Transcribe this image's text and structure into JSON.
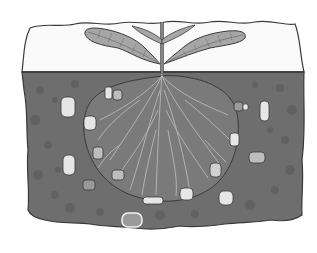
{
  "illustration": {
    "subject": "plant-rhizosphere",
    "description": "Grayscale cross-section of a seedling above ground with its root system in soil, surrounded by soil microbes",
    "colors": {
      "background": "#ffffff",
      "sky": "#fafafa",
      "outline": "#3a3a3a",
      "soil": "#6e6e6e",
      "soil_spots": "#5f5f5f",
      "rhizosphere": "#7a7a7a",
      "roots": "#b8b8b8",
      "leaf": "#a6a6a6",
      "leaf_vein": "#6a6a6a",
      "microbe_light": "#e6e6e6",
      "microbe_mid": "#bdbdbd"
    },
    "microbes": [
      {
        "x": 68,
        "y": 107,
        "w": 14,
        "h": 20,
        "tone": "light"
      },
      {
        "x": 108,
        "y": 93,
        "w": 7,
        "h": 12,
        "tone": "light"
      },
      {
        "x": 117,
        "y": 95,
        "w": 9,
        "h": 10,
        "tone": "mid"
      },
      {
        "x": 90,
        "y": 123,
        "w": 12,
        "h": 14,
        "tone": "light"
      },
      {
        "x": 70,
        "y": 160,
        "w": 12,
        "h": 20,
        "tone": "light"
      },
      {
        "x": 98,
        "y": 152,
        "w": 10,
        "h": 12,
        "tone": "mid"
      },
      {
        "x": 88,
        "y": 185,
        "w": 12,
        "h": 10,
        "tone": "mid"
      },
      {
        "x": 118,
        "y": 175,
        "w": 12,
        "h": 10,
        "tone": "mid"
      },
      {
        "x": 150,
        "y": 198,
        "w": 18,
        "h": 7,
        "tone": "light"
      },
      {
        "x": 186,
        "y": 190,
        "w": 13,
        "h": 12,
        "tone": "light"
      },
      {
        "x": 218,
        "y": 168,
        "w": 11,
        "h": 14,
        "tone": "light"
      },
      {
        "x": 226,
        "y": 194,
        "w": 14,
        "h": 14,
        "tone": "light"
      },
      {
        "x": 233,
        "y": 140,
        "w": 9,
        "h": 12,
        "tone": "light"
      },
      {
        "x": 256,
        "y": 157,
        "w": 14,
        "h": 10,
        "tone": "mid"
      },
      {
        "x": 236,
        "y": 104,
        "w": 9,
        "h": 9,
        "tone": "mid"
      },
      {
        "x": 263,
        "y": 105,
        "w": 9,
        "h": 18,
        "tone": "light"
      },
      {
        "x": 133,
        "y": 218,
        "w": 15,
        "h": 12,
        "tone": "light"
      }
    ]
  }
}
